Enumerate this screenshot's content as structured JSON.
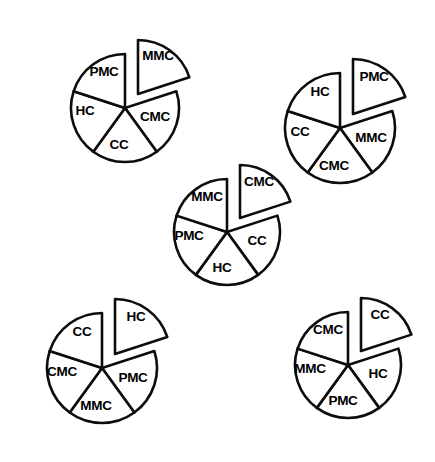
{
  "figure": {
    "type": "pie-chart-panel",
    "background_color": "#ffffff",
    "stroke_color": "#0d0d0d",
    "label_color": "#000000",
    "chart_count": 5,
    "slices_per_chart": 5,
    "style": "line-art, unfilled wedges, one exploded slice per pie"
  },
  "chart_data": [
    {
      "type": "pie",
      "name": "chart-top-left",
      "title": "",
      "categories": [
        "MMC",
        "CMC",
        "CC",
        "HC",
        "PMC"
      ],
      "values": [
        20,
        20,
        20,
        20,
        20
      ],
      "exploded": "MMC",
      "start_angle_deg": 0,
      "direction": "clockwise",
      "center": {
        "x": 125,
        "y": 108
      },
      "radius": 54,
      "explode_offset": {
        "x": 13,
        "y": -14
      },
      "legend": "none",
      "label_positions": [
        {
          "label": "MMC",
          "x": 158,
          "y": 56
        },
        {
          "label": "CMC",
          "x": 155,
          "y": 117
        },
        {
          "label": "CC",
          "x": 119,
          "y": 145
        },
        {
          "label": "HC",
          "x": 85,
          "y": 111
        },
        {
          "label": "PMC",
          "x": 104,
          "y": 72
        }
      ]
    },
    {
      "type": "pie",
      "name": "chart-top-right",
      "title": "",
      "categories": [
        "PMC",
        "MMC",
        "CMC",
        "CC",
        "HC"
      ],
      "values": [
        20,
        20,
        20,
        20,
        20
      ],
      "exploded": "PMC",
      "start_angle_deg": 0,
      "direction": "clockwise",
      "center": {
        "x": 340,
        "y": 128
      },
      "radius": 55,
      "explode_offset": {
        "x": 13,
        "y": -14
      },
      "legend": "none",
      "label_positions": [
        {
          "label": "PMC",
          "x": 374,
          "y": 77
        },
        {
          "label": "MMC",
          "x": 371,
          "y": 138
        },
        {
          "label": "CMC",
          "x": 334,
          "y": 166
        },
        {
          "label": "CC",
          "x": 300,
          "y": 132
        },
        {
          "label": "HC",
          "x": 320,
          "y": 92
        }
      ]
    },
    {
      "type": "pie",
      "name": "chart-center",
      "title": "",
      "categories": [
        "CMC",
        "CC",
        "HC",
        "PMC",
        "MMC"
      ],
      "values": [
        20,
        20,
        20,
        20,
        20
      ],
      "exploded": "CMC",
      "start_angle_deg": 0,
      "direction": "clockwise",
      "center": {
        "x": 227,
        "y": 232
      },
      "radius": 53,
      "explode_offset": {
        "x": 13,
        "y": -14
      },
      "legend": "none",
      "label_positions": [
        {
          "label": "CMC",
          "x": 259,
          "y": 182
        },
        {
          "label": "CC",
          "x": 257,
          "y": 241
        },
        {
          "label": "HC",
          "x": 222,
          "y": 268
        },
        {
          "label": "PMC",
          "x": 189,
          "y": 236
        },
        {
          "label": "MMC",
          "x": 207,
          "y": 197
        }
      ]
    },
    {
      "type": "pie",
      "name": "chart-bottom-left",
      "title": "",
      "categories": [
        "HC",
        "PMC",
        "MMC",
        "CMC",
        "CC"
      ],
      "values": [
        20,
        20,
        20,
        20,
        20
      ],
      "exploded": "HC",
      "start_angle_deg": 0,
      "direction": "clockwise",
      "center": {
        "x": 102,
        "y": 368
      },
      "radius": 55,
      "explode_offset": {
        "x": 13,
        "y": -14
      },
      "legend": "none",
      "label_positions": [
        {
          "label": "HC",
          "x": 136,
          "y": 317
        },
        {
          "label": "PMC",
          "x": 133,
          "y": 378
        },
        {
          "label": "MMC",
          "x": 96,
          "y": 406
        },
        {
          "label": "CMC",
          "x": 62,
          "y": 372
        },
        {
          "label": "CC",
          "x": 82,
          "y": 332
        }
      ]
    },
    {
      "type": "pie",
      "name": "chart-bottom-right",
      "title": "",
      "categories": [
        "CC",
        "HC",
        "PMC",
        "MMC",
        "CMC"
      ],
      "values": [
        20,
        20,
        20,
        20,
        20
      ],
      "exploded": "CC",
      "start_angle_deg": 0,
      "direction": "clockwise",
      "center": {
        "x": 348,
        "y": 365
      },
      "radius": 53,
      "explode_offset": {
        "x": 13,
        "y": -14
      },
      "legend": "none",
      "label_positions": [
        {
          "label": "CC",
          "x": 380,
          "y": 315
        },
        {
          "label": "HC",
          "x": 378,
          "y": 374
        },
        {
          "label": "PMC",
          "x": 343,
          "y": 401
        },
        {
          "label": "MMC",
          "x": 310,
          "y": 369
        },
        {
          "label": "CMC",
          "x": 328,
          "y": 330
        }
      ]
    }
  ]
}
